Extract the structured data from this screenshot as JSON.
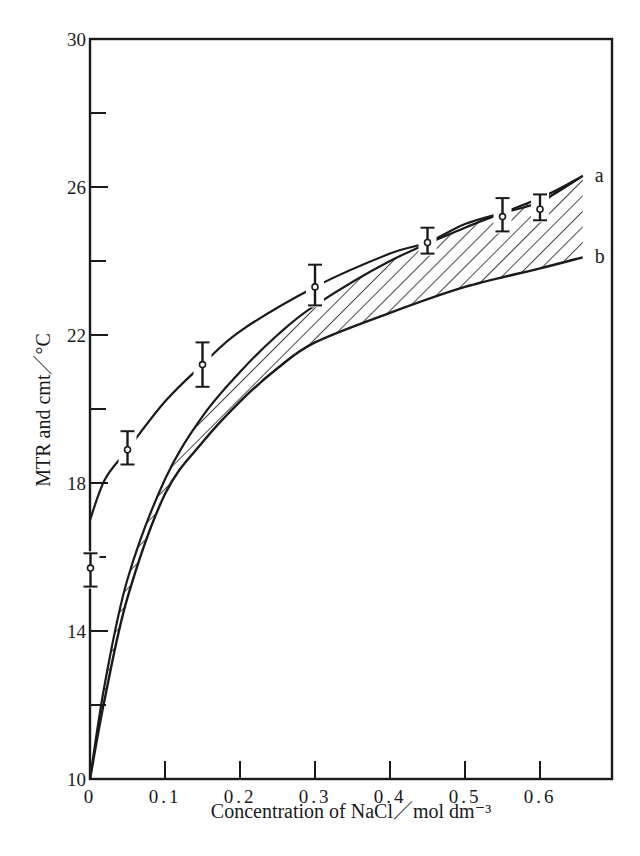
{
  "chart_data": {
    "type": "line",
    "title": "",
    "xlabel": "Concentration of NaCl／mol  dm⁻³",
    "ylabel": "MTR and cmt／°C",
    "xlim": [
      0,
      0.693
    ],
    "ylim": [
      10,
      30
    ],
    "x_ticks": [
      0,
      0.1,
      0.2,
      0.3,
      0.4,
      0.5,
      0.6
    ],
    "x_tick_labels": [
      "0",
      "0.1",
      "0.2",
      "0.3",
      "0.4",
      "0.5",
      "0.6"
    ],
    "y_ticks_major": [
      10,
      14,
      18,
      22,
      26,
      30
    ],
    "y_tick_labels": [
      "10",
      "14",
      "18",
      "22",
      "26",
      "30"
    ],
    "y_ticks_minor": [
      12,
      16,
      20,
      24,
      28
    ],
    "grid": false,
    "legend": "none (curves labeled inline)",
    "series": [
      {
        "name": "a",
        "description": "MTR curve (upper line)",
        "x": [
          0,
          0.02,
          0.05,
          0.1,
          0.15,
          0.2,
          0.3,
          0.4,
          0.45,
          0.5,
          0.55,
          0.6,
          0.657
        ],
        "y": [
          17.0,
          18.1,
          18.9,
          20.2,
          21.2,
          22.1,
          23.3,
          24.2,
          24.5,
          25.0,
          25.3,
          25.6,
          26.3
        ]
      },
      {
        "name": "band-upper",
        "description": "upper edge of hatched cmt band",
        "x": [
          0,
          0.02,
          0.05,
          0.1,
          0.15,
          0.2,
          0.25,
          0.3,
          0.4,
          0.5,
          0.6,
          0.657
        ],
        "y": [
          10,
          12.6,
          15.4,
          18.1,
          19.8,
          21.0,
          22.0,
          22.8,
          24.0,
          24.9,
          25.7,
          26.3
        ]
      },
      {
        "name": "b",
        "description": "lower edge of hatched cmt band",
        "x": [
          0,
          0.02,
          0.05,
          0.1,
          0.15,
          0.2,
          0.25,
          0.3,
          0.4,
          0.5,
          0.6,
          0.657
        ],
        "y": [
          10,
          12.2,
          14.9,
          17.7,
          19.1,
          20.2,
          21.1,
          21.8,
          22.6,
          23.3,
          23.8,
          24.1
        ]
      }
    ],
    "points": {
      "name": "MTR measurements",
      "x": [
        0,
        0.05,
        0.15,
        0.3,
        0.45,
        0.55,
        0.6
      ],
      "y": [
        15.7,
        18.9,
        21.2,
        23.3,
        24.5,
        25.2,
        25.4
      ],
      "err_low": [
        15.2,
        18.5,
        20.6,
        22.8,
        24.2,
        24.8,
        25.1
      ],
      "err_high": [
        16.1,
        19.4,
        21.8,
        23.9,
        24.9,
        25.7,
        25.8
      ]
    },
    "annotations": [
      {
        "text": "a",
        "x": 0.673,
        "y": 26.3
      },
      {
        "text": "b",
        "x": 0.673,
        "y": 24.1
      }
    ]
  },
  "style": {
    "ink": "#1a1a1a",
    "background": "#ffffff"
  }
}
